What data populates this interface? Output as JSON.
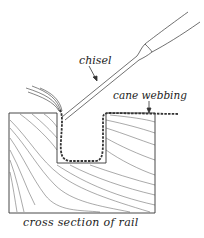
{
  "labels": {
    "chisel": "chisel",
    "cane_webbing": "cane webbing",
    "caption": "cross section of rail"
  },
  "colors": {
    "ink": "#333333",
    "background": "#ffffff"
  }
}
